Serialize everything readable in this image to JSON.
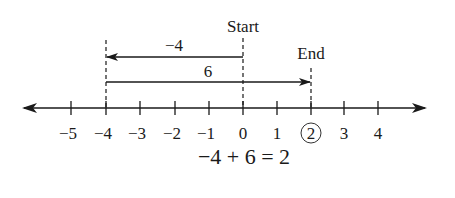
{
  "diagram": {
    "type": "number-line",
    "axis": {
      "min_tick": -5,
      "max_tick": 4,
      "ticks": [
        {
          "value": -5,
          "label": "−5",
          "x": 71
        },
        {
          "value": -4,
          "label": "−4",
          "x": 106
        },
        {
          "value": -3,
          "label": "−3",
          "x": 140
        },
        {
          "value": -2,
          "label": "−2",
          "x": 175
        },
        {
          "value": -1,
          "label": "−1",
          "x": 209
        },
        {
          "value": 0,
          "label": "0",
          "x": 243
        },
        {
          "value": 1,
          "label": "1",
          "x": 277
        },
        {
          "value": 2,
          "label": "2",
          "x": 311,
          "circled": true
        },
        {
          "value": 3,
          "label": "3",
          "x": 344
        },
        {
          "value": 4,
          "label": "4",
          "x": 378
        }
      ],
      "arrows_both_ends": true
    },
    "markers": {
      "start": {
        "label": "Start",
        "value": 0
      },
      "end": {
        "label": "End",
        "value": 2
      }
    },
    "moves": [
      {
        "label": "−4",
        "from": 0,
        "to": -4,
        "direction": "left"
      },
      {
        "label": "6",
        "from": -4,
        "to": 2,
        "direction": "right"
      }
    ],
    "equation": "−4 + 6 = 2",
    "colors": {
      "ink": "#1a1a1a",
      "background": "#ffffff"
    }
  }
}
